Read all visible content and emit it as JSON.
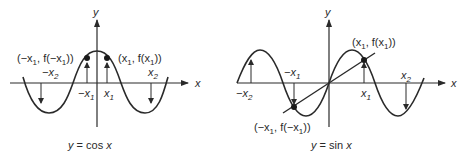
{
  "figures": [
    {
      "id": "cos",
      "caption": "y = cos x",
      "caption_parts": {
        "y": "y",
        "eq": " = cos ",
        "x": "x"
      },
      "axis_labels": {
        "x": "x",
        "y": "y"
      },
      "points": {
        "left": {
          "label_pre": "(−x",
          "sub": "1",
          "mid": ", f(−x",
          "sub2": "1",
          "post": "))"
        },
        "right": {
          "label_pre": "(x",
          "sub": "1",
          "mid": ", f(x",
          "sub2": "1",
          "post": "))"
        }
      },
      "ticks": {
        "neg_x1": {
          "pre": "−x",
          "sub": "1"
        },
        "x1": {
          "pre": "x",
          "sub": "1"
        },
        "neg_x2": {
          "pre": "−x",
          "sub": "2"
        },
        "x2": {
          "pre": "x",
          "sub": "2"
        }
      },
      "property": "even function: f(−x) = f(x)"
    },
    {
      "id": "sin",
      "caption": "y = sin x",
      "caption_parts": {
        "y": "y",
        "eq": " = sin ",
        "x": "x"
      },
      "axis_labels": {
        "x": "x",
        "y": "y"
      },
      "points": {
        "left": {
          "label_pre": "(−x",
          "sub": "1",
          "mid": ", f(−x",
          "sub2": "1",
          "post": "))"
        },
        "right": {
          "label_pre": "(x",
          "sub": "1",
          "mid": ", f(x",
          "sub2": "1",
          "post": "))"
        }
      },
      "ticks": {
        "neg_x1": {
          "pre": "−x",
          "sub": "1"
        },
        "x1": {
          "pre": "x",
          "sub": "1"
        },
        "neg_x2": {
          "pre": "−x",
          "sub": "2"
        },
        "x2": {
          "pre": "x",
          "sub": "2"
        }
      },
      "property": "odd function: f(−x) = −f(x)"
    }
  ],
  "colors": {
    "ink": "#2a2a2a",
    "background": "#ffffff"
  }
}
